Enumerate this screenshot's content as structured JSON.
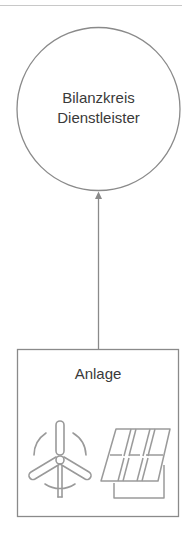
{
  "header": {
    "cut_off_text": "ʼ"
  },
  "nodes": {
    "service_provider": {
      "line1": "Bilanzkreis",
      "line2": "Dienstleister",
      "shape": "circle"
    },
    "plant": {
      "label": "Anlage",
      "shape": "rectangle",
      "icons": [
        "wind-turbine-icon",
        "solar-panel-icon"
      ]
    }
  },
  "edges": [
    {
      "from": "plant",
      "to": "service_provider",
      "type": "arrow"
    }
  ],
  "colors": {
    "stroke": "#8a8a8a",
    "icon": "#9a9a9a",
    "text": "#3a3a3a"
  }
}
